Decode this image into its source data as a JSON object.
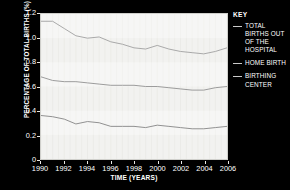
{
  "chart_data": {
    "type": "line",
    "title": "",
    "xlabel": "TIME (YEARS)",
    "ylabel": "PERCENTAGE OF TOTAL BIRTHS (%)",
    "xlim": [
      1990,
      2006
    ],
    "ylim": [
      0,
      1.2
    ],
    "grid": "vertical-faint",
    "legend_position": "right",
    "legend_title": "KEY",
    "x": [
      1990,
      1991,
      1992,
      1993,
      1994,
      1995,
      1996,
      1997,
      1998,
      1999,
      2000,
      2001,
      2002,
      2003,
      2004,
      2005,
      2006
    ],
    "xticks": [
      "1990",
      "1992",
      "1994",
      "1996",
      "1998",
      "2000",
      "2002",
      "2004",
      "2006"
    ],
    "xtick_values": [
      1990,
      1992,
      1994,
      1996,
      1998,
      2000,
      2002,
      2004,
      2006
    ],
    "yticks": [
      "0",
      "0.2",
      "0.4",
      "0.6",
      "0.8",
      "1.0",
      "1.2"
    ],
    "ytick_values": [
      0,
      0.2,
      0.4,
      0.6,
      0.8,
      1.0,
      1.2
    ],
    "series": [
      {
        "name": "TOTAL BIRTHS OUT OF THE HOSPITAL",
        "color": "#a8a8a8",
        "values": [
          1.14,
          1.14,
          1.08,
          1.02,
          1.0,
          1.01,
          0.97,
          0.95,
          0.92,
          0.91,
          0.94,
          0.91,
          0.89,
          0.88,
          0.87,
          0.89,
          0.92
        ]
      },
      {
        "name": "HOME BIRTH",
        "color": "#9a9a9a",
        "values": [
          0.68,
          0.65,
          0.64,
          0.64,
          0.63,
          0.62,
          0.61,
          0.61,
          0.61,
          0.6,
          0.6,
          0.59,
          0.58,
          0.57,
          0.57,
          0.59,
          0.6
        ]
      },
      {
        "name": "BIRTHING CENTER",
        "color": "#8f8f8f",
        "values": [
          0.36,
          0.35,
          0.33,
          0.29,
          0.31,
          0.3,
          0.27,
          0.27,
          0.27,
          0.26,
          0.28,
          0.27,
          0.26,
          0.25,
          0.25,
          0.26,
          0.27
        ]
      }
    ]
  },
  "legend": {
    "title": "KEY",
    "items": [
      {
        "label": "TOTAL BIRTHS OUT OF THE HOSPITAL"
      },
      {
        "label": "HOME BIRTH"
      },
      {
        "label": "BIRTHING CENTER"
      }
    ]
  },
  "axes": {
    "x_title": "TIME (YEARS)",
    "y_title": "PERCENTAGE OF TOTAL BIRTHS (%)"
  },
  "colors": {
    "background": "#000000",
    "plot_background": "#f2f2f0",
    "text": "#ffffff",
    "line": "#a0a0a0"
  }
}
